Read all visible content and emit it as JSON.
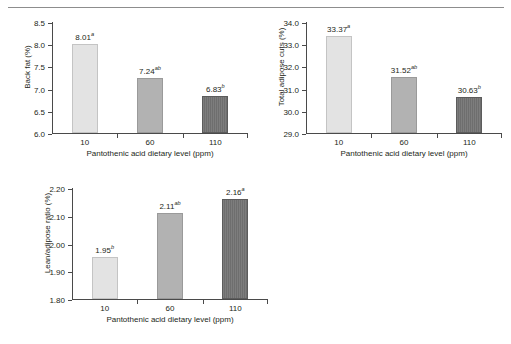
{
  "figure": {
    "x_axis_title": "Pantothenic acid dietary level (ppm)",
    "categories": [
      "10",
      "60",
      "110"
    ],
    "bar_colors": [
      "#e3e3e3",
      "#b2b2b2",
      "#6e6e6e"
    ]
  },
  "chart_data": [
    {
      "type": "bar",
      "name": "back-fat",
      "title": "",
      "xlabel": "Pantothenic acid dietary level (ppm)",
      "ylabel": "Back fat (%)",
      "categories": [
        "10",
        "60",
        "110"
      ],
      "values": [
        8.01,
        7.24,
        6.83
      ],
      "value_labels": [
        "8.01",
        "7.24",
        "6.83"
      ],
      "superscripts": [
        "a",
        "ab",
        "b"
      ],
      "ylim": [
        6.0,
        8.5
      ],
      "yticks": [
        6.0,
        6.5,
        7.0,
        7.5,
        8.0,
        8.5
      ],
      "ytick_labels": [
        "6.0",
        "6.5",
        "7.0",
        "7.5",
        "8.0",
        "8.5"
      ],
      "grid": false,
      "legend": "none"
    },
    {
      "type": "bar",
      "name": "total-adipose-cuts",
      "title": "",
      "xlabel": "Pantothenic acid dietary level (ppm)",
      "ylabel": "Total adipose cuts (%)",
      "categories": [
        "10",
        "60",
        "110"
      ],
      "values": [
        33.37,
        31.52,
        30.63
      ],
      "value_labels": [
        "33.37",
        "31.52",
        "30.63"
      ],
      "superscripts": [
        "a",
        "ab",
        "b"
      ],
      "ylim": [
        29.0,
        34.0
      ],
      "yticks": [
        29.0,
        30.0,
        31.0,
        32.0,
        33.0,
        34.0
      ],
      "ytick_labels": [
        "29.0",
        "30.0",
        "31.0",
        "32.0",
        "33.0",
        "34.0"
      ],
      "grid": false,
      "legend": "none"
    },
    {
      "type": "bar",
      "name": "lean-adipose-ratio",
      "title": "",
      "xlabel": "Pantothenic acid dietary level (ppm)",
      "ylabel": "Lean/adipose ratio (%)",
      "categories": [
        "10",
        "60",
        "110"
      ],
      "values": [
        1.95,
        2.11,
        2.16
      ],
      "value_labels": [
        "1.95",
        "2.11",
        "2.16"
      ],
      "superscripts": [
        "b",
        "ab",
        "a"
      ],
      "ylim": [
        1.8,
        2.2
      ],
      "yticks": [
        1.8,
        1.9,
        2.0,
        2.1,
        2.2
      ],
      "ytick_labels": [
        "1.80",
        "1.90",
        "2.00",
        "2.10",
        "2.20"
      ],
      "grid": false,
      "legend": "none"
    }
  ]
}
